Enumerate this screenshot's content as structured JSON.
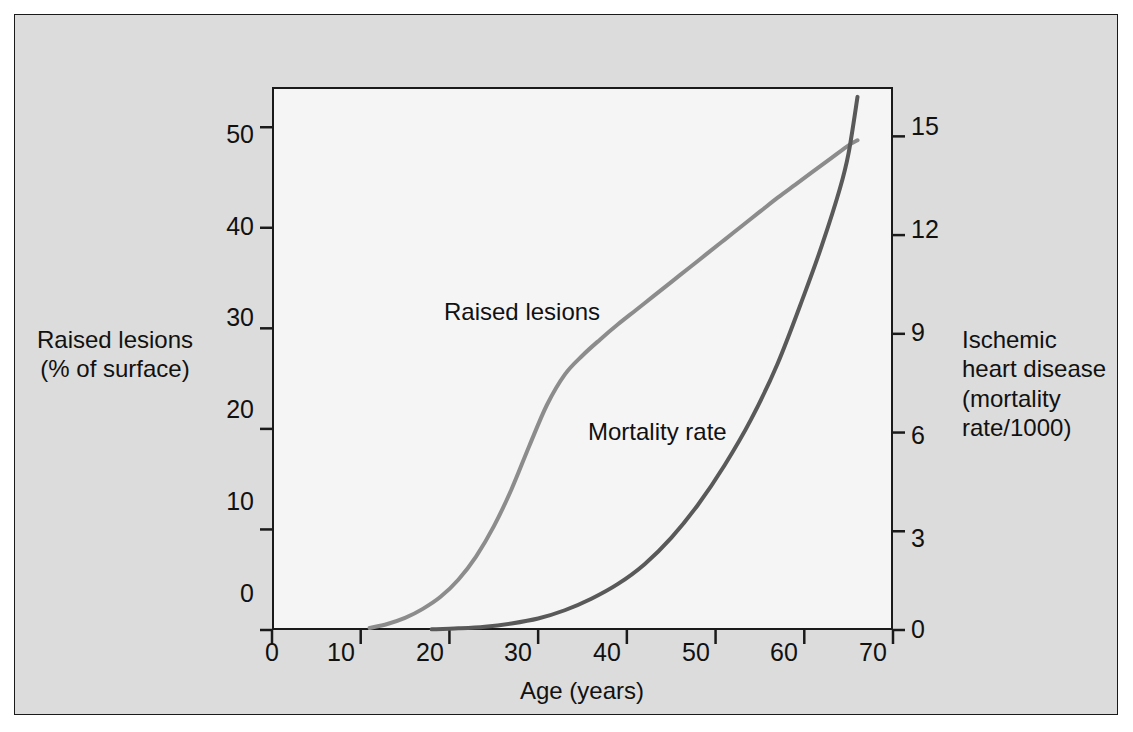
{
  "figure": {
    "background_color": "#dcdcdc",
    "plot_background_color": "#f5f5f5",
    "border_color": "#1a1a1a"
  },
  "chart_data": {
    "type": "line",
    "title": "",
    "xlabel": "Age (years)",
    "ylabel": "Raised lesions\n(% of surface)",
    "y2label": "Ischemic\nheart disease\n(mortality\nrate/1000)",
    "xlim": [
      0,
      70
    ],
    "ylim": [
      0,
      54
    ],
    "y2lim": [
      0,
      16.5
    ],
    "xticks": [
      0,
      10,
      20,
      30,
      40,
      50,
      60,
      70
    ],
    "xticklabels": [
      "0",
      "10",
      "20",
      "30",
      "40",
      "50",
      "60",
      "70"
    ],
    "yticks": [
      0,
      10,
      20,
      30,
      40,
      50
    ],
    "yticklabels": [
      "0",
      "10",
      "20",
      "30",
      "40",
      "50"
    ],
    "y2ticks": [
      0,
      3,
      6,
      9,
      12,
      15
    ],
    "y2ticklabels": [
      "0",
      "3",
      "6",
      "9",
      "12",
      "15"
    ],
    "grid": false,
    "legend": "inline-annotations",
    "series": [
      {
        "name": "Raised lesions",
        "axis": "left",
        "color": "#8c8c8c",
        "label_text": "Raised lesions",
        "x": [
          11,
          13,
          15,
          17,
          19,
          21,
          23,
          25,
          27,
          29,
          31,
          33,
          35,
          37,
          39,
          41,
          43,
          45,
          47,
          49,
          51,
          53,
          55,
          57,
          59,
          61,
          63,
          65,
          66
        ],
        "y": [
          0.2,
          0.6,
          1.2,
          2.1,
          3.3,
          5.0,
          7.3,
          10.3,
          14.0,
          18.3,
          22.4,
          25.4,
          27.3,
          28.9,
          30.4,
          31.8,
          33.2,
          34.6,
          36.0,
          37.4,
          38.8,
          40.2,
          41.6,
          43.0,
          44.3,
          45.6,
          46.9,
          48.2,
          48.7
        ]
      },
      {
        "name": "Mortality rate",
        "axis": "right",
        "color": "#595959",
        "label_text": "Mortality rate",
        "x": [
          18,
          21,
          24,
          27,
          30,
          33,
          36,
          39,
          42,
          45,
          48,
          51,
          54,
          57,
          60,
          62,
          64,
          65,
          66
        ],
        "y": [
          0.02,
          0.05,
          0.1,
          0.2,
          0.35,
          0.6,
          0.95,
          1.4,
          2.0,
          2.8,
          3.8,
          5.0,
          6.4,
          8.1,
          10.2,
          11.7,
          13.4,
          14.5,
          16.2
        ]
      }
    ]
  },
  "annotations": {
    "raised_lesions_label": "Raised lesions",
    "mortality_rate_label": "Mortality rate"
  }
}
